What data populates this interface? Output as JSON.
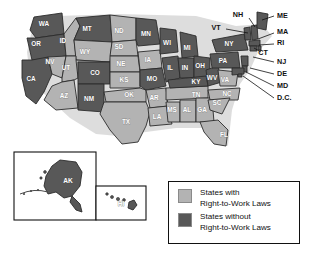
{
  "map": {
    "title": "Right-to-Work Laws by State",
    "colors": {
      "with_law": "#b3b3b3",
      "without_law": "#585858",
      "outline": "#2b2b2b",
      "background": "#ffffff",
      "label_text": "#111111"
    },
    "states": [
      {
        "code": "WA",
        "status": "without",
        "x": 44,
        "y": 24
      },
      {
        "code": "OR",
        "status": "without",
        "x": 36,
        "y": 44
      },
      {
        "code": "CA",
        "status": "without",
        "x": 31,
        "y": 79
      },
      {
        "code": "NV",
        "status": "with",
        "x": 50,
        "y": 62
      },
      {
        "code": "ID",
        "status": "with",
        "x": 63,
        "y": 41
      },
      {
        "code": "MT",
        "status": "without",
        "x": 87,
        "y": 29
      },
      {
        "code": "WY",
        "status": "with",
        "x": 85,
        "y": 52
      },
      {
        "code": "UT",
        "status": "with",
        "x": 66,
        "y": 68
      },
      {
        "code": "AZ",
        "status": "with",
        "x": 64,
        "y": 96
      },
      {
        "code": "CO",
        "status": "without",
        "x": 95,
        "y": 73
      },
      {
        "code": "NM",
        "status": "without",
        "x": 89,
        "y": 99
      },
      {
        "code": "ND",
        "status": "with",
        "x": 119,
        "y": 31
      },
      {
        "code": "SD",
        "status": "with",
        "x": 119,
        "y": 47
      },
      {
        "code": "NE",
        "status": "with",
        "x": 121,
        "y": 64
      },
      {
        "code": "KS",
        "status": "with",
        "x": 124,
        "y": 80
      },
      {
        "code": "OK",
        "status": "with",
        "x": 129,
        "y": 95
      },
      {
        "code": "TX",
        "status": "with",
        "x": 126,
        "y": 122
      },
      {
        "code": "MN",
        "status": "without",
        "x": 146,
        "y": 34
      },
      {
        "code": "IA",
        "status": "with",
        "x": 148,
        "y": 60
      },
      {
        "code": "MO",
        "status": "without",
        "x": 152,
        "y": 79
      },
      {
        "code": "AR",
        "status": "with",
        "x": 154,
        "y": 98
      },
      {
        "code": "LA",
        "status": "with",
        "x": 157,
        "y": 117
      },
      {
        "code": "WI",
        "status": "without",
        "x": 167,
        "y": 43
      },
      {
        "code": "IL",
        "status": "without",
        "x": 170,
        "y": 68
      },
      {
        "code": "MS",
        "status": "with",
        "x": 172,
        "y": 110
      },
      {
        "code": "MI",
        "status": "without",
        "x": 187,
        "y": 48
      },
      {
        "code": "IN",
        "status": "without",
        "x": 185,
        "y": 68
      },
      {
        "code": "AL",
        "status": "with",
        "x": 187,
        "y": 110
      },
      {
        "code": "OH",
        "status": "without",
        "x": 200,
        "y": 66
      },
      {
        "code": "KY",
        "status": "without",
        "x": 196,
        "y": 82
      },
      {
        "code": "TN",
        "status": "with",
        "x": 196,
        "y": 95
      },
      {
        "code": "GA",
        "status": "with",
        "x": 202,
        "y": 110
      },
      {
        "code": "WV",
        "status": "without",
        "x": 212,
        "y": 78
      },
      {
        "code": "VA",
        "status": "with",
        "x": 225,
        "y": 80
      },
      {
        "code": "SC",
        "status": "with",
        "x": 217,
        "y": 103
      },
      {
        "code": "NC",
        "status": "with",
        "x": 227,
        "y": 94
      },
      {
        "code": "FL",
        "status": "with",
        "x": 224,
        "y": 135
      },
      {
        "code": "PA",
        "status": "without",
        "x": 223,
        "y": 61
      },
      {
        "code": "NY",
        "status": "without",
        "x": 229,
        "y": 44
      }
    ],
    "callouts": [
      {
        "code": "NH",
        "status": "without",
        "label_x": 238,
        "label_y": 15,
        "line": [
          [
            249,
            18
          ],
          [
            255,
            27
          ]
        ]
      },
      {
        "code": "ME",
        "status": "without",
        "label_x": 277,
        "label_y": 16,
        "line": [
          [
            274,
            16
          ],
          [
            262,
            20
          ]
        ]
      },
      {
        "code": "VT",
        "status": "without",
        "label_x": 216,
        "label_y": 28,
        "line": [
          [
            226,
            29
          ],
          [
            248,
            33
          ]
        ]
      },
      {
        "code": "MA",
        "status": "without",
        "label_x": 277,
        "label_y": 32,
        "line": [
          [
            274,
            33
          ],
          [
            258,
            39
          ]
        ]
      },
      {
        "code": "RI",
        "status": "without",
        "label_x": 277,
        "label_y": 43,
        "line": [
          [
            274,
            44
          ],
          [
            259,
            45
          ]
        ]
      },
      {
        "code": "CT",
        "status": "without",
        "label_x": 263,
        "label_y": 53,
        "line": [
          [
            261,
            52
          ],
          [
            254,
            48
          ]
        ]
      },
      {
        "code": "NJ",
        "status": "without",
        "label_x": 277,
        "label_y": 62,
        "line": [
          [
            274,
            62
          ],
          [
            253,
            57
          ]
        ]
      },
      {
        "code": "DE",
        "status": "without",
        "label_x": 277,
        "label_y": 74,
        "line": [
          [
            274,
            74
          ],
          [
            250,
            68
          ]
        ]
      },
      {
        "code": "MD",
        "status": "without",
        "label_x": 277,
        "label_y": 86,
        "line": [
          [
            274,
            86
          ],
          [
            246,
            72
          ]
        ]
      },
      {
        "code": "D.C.",
        "status": "without",
        "label_x": 277,
        "label_y": 98,
        "line": [
          [
            274,
            98
          ],
          [
            243,
            76
          ]
        ]
      }
    ],
    "insets": [
      {
        "code": "AK",
        "status": "without",
        "label_x": 68,
        "label_y": 181
      },
      {
        "code": "HI",
        "status": "without",
        "label_x": 121,
        "label_y": 204
      }
    ]
  },
  "legend": {
    "items": [
      {
        "swatch": "with_law",
        "line1": "States with",
        "line2": "Right-to-Work Laws"
      },
      {
        "swatch": "without_law",
        "line1": "States without",
        "line2": "Right-to-Work Laws"
      }
    ]
  }
}
